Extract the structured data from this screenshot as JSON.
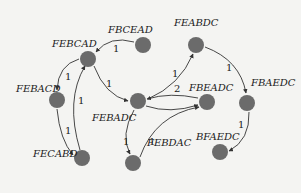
{
  "diagram": {
    "type": "directed-weighted-graph",
    "node_color": "#6b6b6b",
    "edge_color": "#333333",
    "nodes": [
      {
        "id": "FBCEAD",
        "label": "FBCEAD",
        "x": 143,
        "y": 45,
        "lx": 108,
        "ly": 33
      },
      {
        "id": "FEBCAD",
        "label": "FEBCAD",
        "x": 88,
        "y": 59,
        "lx": 52,
        "ly": 47
      },
      {
        "id": "FEABDC",
        "label": "FEABDC",
        "x": 196,
        "y": 45,
        "lx": 174,
        "ly": 26
      },
      {
        "id": "FEBACD",
        "label": "FEBACD",
        "x": 57,
        "y": 100,
        "lx": 16,
        "ly": 92
      },
      {
        "id": "FEBADC",
        "label": "FEBADC",
        "x": 138,
        "y": 101,
        "lx": 92,
        "ly": 121
      },
      {
        "id": "FBEADC",
        "label": "FBEADC",
        "x": 207,
        "y": 102,
        "lx": 189,
        "ly": 91
      },
      {
        "id": "FBAEDC",
        "label": "FBAEDC",
        "x": 247,
        "y": 103,
        "lx": 251,
        "ly": 86
      },
      {
        "id": "FECABD",
        "label": "FECABD",
        "x": 82,
        "y": 158,
        "lx": 33,
        "ly": 157
      },
      {
        "id": "FEBDAC",
        "label": "FEBDAC",
        "x": 133,
        "y": 163,
        "lx": 147,
        "ly": 146
      },
      {
        "id": "BFAEDC",
        "label": "BFAEDC",
        "x": 220,
        "y": 152,
        "lx": 196,
        "ly": 140
      }
    ],
    "edges": [
      {
        "from": "FBCEAD",
        "to": "FEBCAD",
        "weight": "1",
        "path": "M134,42 Q110,35 96,52",
        "wx": 113,
        "wy": 52
      },
      {
        "from": "FEBCAD",
        "to": "FEBACD",
        "weight": "1",
        "path": "M79,59 Q58,65 57,90",
        "wx": 65,
        "wy": 80
      },
      {
        "from": "FEBACD",
        "to": "FECABD",
        "weight": "1",
        "path": "M57,109 Q60,140 73,155",
        "wx": 65,
        "wy": 134
      },
      {
        "from": "FECABD",
        "to": "FEBCAD",
        "weight": "1",
        "path": "M80,150 Q65,100 85,66",
        "wx": 78,
        "wy": 104
      },
      {
        "from": "FEBCAD",
        "to": "FEBADC",
        "weight": "1",
        "path": "M94,66 Q105,95 128,101",
        "wx": 106,
        "wy": 87
      },
      {
        "from": "FEBADC",
        "to": "FEABDC",
        "weight": "1",
        "path": "M148,99 Q180,85 193,54",
        "wx": 172,
        "wy": 77
      },
      {
        "from": "FEABDC",
        "to": "FBAEDC",
        "weight": "1",
        "path": "M205,47 Q240,60 246,93",
        "wx": 226,
        "wy": 71
      },
      {
        "from": "FBAEDC",
        "to": "BFAEDC",
        "weight": "1",
        "path": "M249,112 Q250,140 229,151",
        "wx": 238,
        "wy": 128
      },
      {
        "from": "FBEADC",
        "to": "FEBADC",
        "weight": "2",
        "path": "M198,98 Q170,92 147,99",
        "wx": 174,
        "wy": 92
      },
      {
        "from": "FEBADC",
        "to": "FBEADC",
        "weight": "",
        "path": "M146,106 Q170,114 198,105",
        "wx": 0,
        "wy": 0
      },
      {
        "from": "FEBADC",
        "to": "FEBDAC",
        "weight": "1",
        "path": "M134,110 Q120,135 130,154",
        "wx": 123,
        "wy": 145
      },
      {
        "from": "FEBDAC",
        "to": "FBEADC",
        "weight": "1",
        "path": "M140,157 Q155,115 199,107",
        "wx": 149,
        "wy": 145
      }
    ]
  }
}
